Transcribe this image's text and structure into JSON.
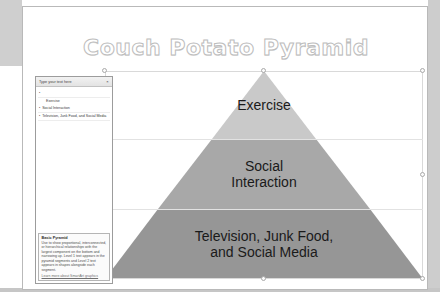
{
  "slide": {
    "title": "Couch Potato Pyramid"
  },
  "pyramid": {
    "tiers": [
      {
        "label": "Exercise",
        "color": "#c9c9c9"
      },
      {
        "label": "Social\nInteraction",
        "line1": "Social",
        "line2": "Interaction",
        "color": "#a8a8a8"
      },
      {
        "label": "Television, Junk Food,\nand Social Media",
        "line1": "Television, Junk Food,",
        "line2": "and Social Media",
        "color": "#969696"
      }
    ]
  },
  "text_pane": {
    "header_title": "Type your text here",
    "close_label": "×",
    "bullet_glyph": "•",
    "items": [
      {
        "text": "",
        "level": 1
      },
      {
        "text": "Exercise",
        "level": 2
      },
      {
        "text": "Social Interaction",
        "level": 1
      },
      {
        "text": "Television, Junk Food, and Social Media",
        "level": 1
      }
    ],
    "description": {
      "title": "Basic Pyramid",
      "body": "Use to show proportional, interconnected, or hierarchical relationships with the largest component on the bottom and narrowing up. Level 1 text appears in the pyramid segments and Level 2 text appears in shapes alongside each segment.",
      "link": "Learn more about SmartArt graphics"
    }
  },
  "caption": {
    "text": ""
  },
  "colors": {
    "tier_top": "#c9c9c9",
    "tier_mid": "#a8a8a8",
    "tier_bottom": "#969696",
    "selection_border": "#d9d9d9",
    "title_outline": "#bdbdbd"
  }
}
